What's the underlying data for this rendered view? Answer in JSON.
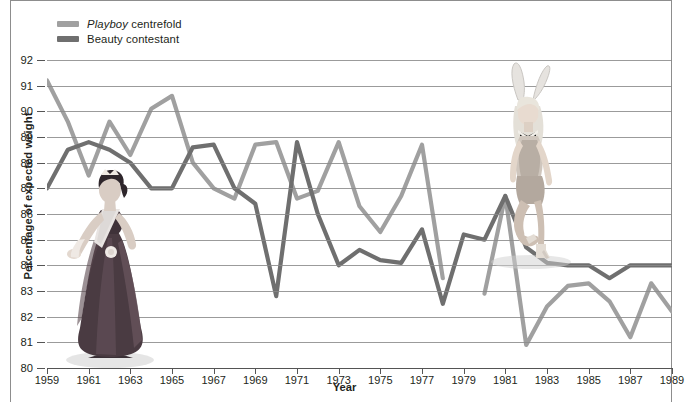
{
  "chart_data": {
    "type": "line",
    "title": "",
    "xlabel": "Year",
    "ylabel": "Percentage of expected weight",
    "xlim": [
      1959,
      1989
    ],
    "ylim": [
      80,
      92
    ],
    "grid": true,
    "legend_position": "top-left",
    "y_ticks": [
      92,
      91,
      90,
      89,
      88,
      87,
      86,
      85,
      84,
      83,
      82,
      81,
      80
    ],
    "x_ticks": [
      1959,
      1961,
      1963,
      1965,
      1967,
      1969,
      1971,
      1973,
      1975,
      1977,
      1979,
      1981,
      1983,
      1985,
      1987,
      1989
    ],
    "series": [
      {
        "name": "Playboy centrefold",
        "color": "#a0a0a0",
        "x": [
          1959,
          1960,
          1961,
          1962,
          1963,
          1964,
          1965,
          1966,
          1967,
          1968,
          1969,
          1970,
          1971,
          1972,
          1973,
          1974,
          1975,
          1976,
          1977,
          1978,
          1980,
          1981,
          1982,
          1983,
          1984,
          1985,
          1986,
          1987,
          1988,
          1989
        ],
        "values": [
          91.2,
          89.6,
          87.5,
          89.6,
          88.3,
          90.1,
          90.6,
          88.0,
          87.0,
          86.6,
          88.7,
          88.8,
          86.6,
          86.9,
          88.8,
          86.3,
          85.3,
          86.7,
          88.7,
          83.5,
          82.9,
          86.7,
          80.9,
          82.4,
          83.2,
          83.3,
          82.6,
          81.2,
          83.3,
          82.2
        ]
      },
      {
        "name": "Beauty contestant",
        "color": "#6f6f6f",
        "x": [
          1959,
          1960,
          1961,
          1962,
          1963,
          1964,
          1965,
          1966,
          1967,
          1968,
          1969,
          1970,
          1971,
          1972,
          1973,
          1974,
          1975,
          1976,
          1977,
          1978,
          1979,
          1980,
          1981,
          1982,
          1983,
          1984,
          1985,
          1986,
          1987,
          1988,
          1989
        ],
        "values": [
          87.0,
          88.5,
          88.8,
          88.5,
          88.0,
          87.0,
          87.0,
          88.6,
          88.7,
          87.0,
          86.4,
          82.8,
          88.8,
          86.0,
          84.0,
          84.6,
          84.2,
          84.1,
          85.4,
          82.5,
          85.2,
          85.0,
          86.7,
          84.7,
          84.1,
          84.0,
          84.0,
          83.5,
          84.0,
          84.0,
          84.0
        ]
      }
    ],
    "gaps": [
      {
        "series": "Playboy centrefold",
        "between": [
          1978,
          1980
        ]
      },
      {
        "series": "Beauty contestant",
        "between": [
          1978,
          1979
        ]
      }
    ]
  },
  "legend": {
    "items": [
      {
        "emphasis": "Playboy",
        "rest": " centrefold",
        "color": "#a0a0a0",
        "swatch_name": "legend-swatch-playboy"
      },
      {
        "emphasis": "",
        "rest": "Beauty contestant",
        "color": "#6f6f6f",
        "swatch_name": "legend-swatch-beauty"
      }
    ]
  },
  "axes": {
    "y_title": "Percentage of expected weight",
    "x_title": "Year"
  },
  "illustrations": [
    {
      "name": "beauty-queen-illustration",
      "alt": "Beauty contestant in gown with sash and tiara"
    },
    {
      "name": "playboy-bunny-illustration",
      "alt": "Playboy bunny in costume with ears and bow tie"
    }
  ]
}
